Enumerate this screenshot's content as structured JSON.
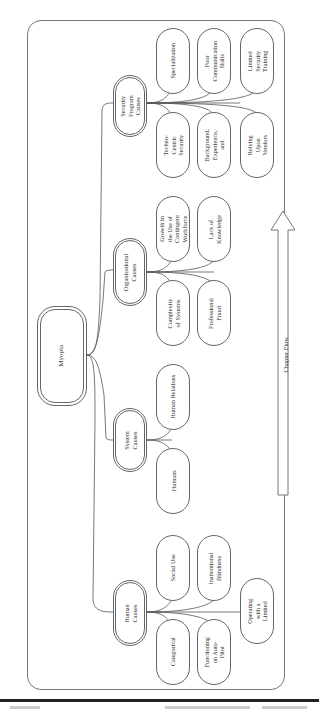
{
  "diagram": {
    "root": {
      "label": "Myopia"
    },
    "categories": [
      {
        "label": "Security Program Causes",
        "children": [
          {
            "label": "Specialization"
          },
          {
            "label": "Techno-Centric Security"
          },
          {
            "label": "Poor Communication Skills"
          },
          {
            "label": "Background, Experience, and"
          },
          {
            "label": "Limited Security Training"
          },
          {
            "label": "Relying Upon Vendors"
          }
        ]
      },
      {
        "label": "Organizational Causes",
        "children": [
          {
            "label": "Growth in the Use of Contingent Workforce"
          },
          {
            "label": "Complexity of Systems"
          },
          {
            "label": "Lack of Knowledge"
          },
          {
            "label": "Professional Fraud"
          }
        ]
      },
      {
        "label": "System Causes",
        "children": [
          {
            "label": "Human Relations"
          },
          {
            "label": "Humans"
          }
        ]
      },
      {
        "label": "Human Causes",
        "children": [
          {
            "label": "Social Use"
          },
          {
            "label": "Categorical"
          },
          {
            "label": "Inattentional Blindness"
          },
          {
            "label": "Functioning on Auto-Pilot"
          },
          {
            "label": "Operating with a Limited"
          }
        ]
      }
    ],
    "flow_arrow": {
      "label": "Chapter Flow"
    }
  }
}
